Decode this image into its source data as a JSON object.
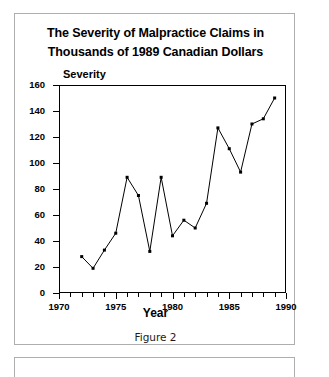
{
  "figure": {
    "caption": "Figure 2",
    "title_line1": "The Severity of Malpractice Claims in",
    "title_line2": "Thousands of 1989 Canadian Dollars"
  },
  "chart_data": {
    "type": "line",
    "title": "The Severity of Malpractice Claims in Thousands of 1989 Canadian Dollars",
    "xlabel": "Year",
    "ylabel": "Severity",
    "xlim": [
      1970,
      1990
    ],
    "ylim": [
      0,
      160
    ],
    "grid": false,
    "legend": null,
    "marker": "filled-square",
    "line_color": "#000000",
    "x_major_ticks": [
      1970,
      1975,
      1980,
      1985,
      1990
    ],
    "x_minor_tick_step": 1,
    "y_ticks": [
      0,
      20,
      40,
      60,
      80,
      100,
      120,
      140,
      160
    ],
    "x": [
      1972,
      1973,
      1974,
      1975,
      1976,
      1977,
      1978,
      1979,
      1980,
      1981,
      1982,
      1983,
      1984,
      1985,
      1986,
      1987,
      1988,
      1989
    ],
    "values": [
      28,
      19,
      33,
      46,
      89,
      75,
      32,
      89,
      44,
      56,
      50,
      69,
      127,
      111,
      93,
      130,
      134,
      150
    ],
    "series": [
      {
        "name": "Severity",
        "points": [
          {
            "x": 1972,
            "y": 28
          },
          {
            "x": 1973,
            "y": 19
          },
          {
            "x": 1974,
            "y": 33
          },
          {
            "x": 1975,
            "y": 46
          },
          {
            "x": 1976,
            "y": 89
          },
          {
            "x": 1977,
            "y": 75
          },
          {
            "x": 1978,
            "y": 32
          },
          {
            "x": 1979,
            "y": 89
          },
          {
            "x": 1980,
            "y": 44
          },
          {
            "x": 1981,
            "y": 56
          },
          {
            "x": 1982,
            "y": 50
          },
          {
            "x": 1983,
            "y": 69
          },
          {
            "x": 1984,
            "y": 127
          },
          {
            "x": 1985,
            "y": 111
          },
          {
            "x": 1986,
            "y": 93
          },
          {
            "x": 1987,
            "y": 130
          },
          {
            "x": 1988,
            "y": 134
          },
          {
            "x": 1989,
            "y": 150
          }
        ]
      }
    ]
  }
}
